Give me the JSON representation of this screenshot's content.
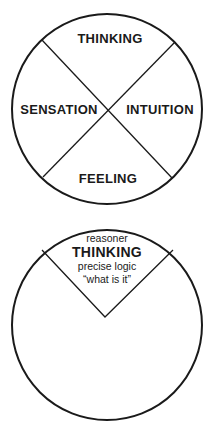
{
  "diagram1": {
    "quadrants": {
      "top": "THINKING",
      "left": "SENSATION",
      "right": "INTUITION",
      "bottom": "FEELING"
    }
  },
  "diagram2": {
    "wedge": {
      "above": "reasoner",
      "title": "THINKING",
      "line1": "precise logic",
      "line2": "“what is it”"
    }
  },
  "colors": {
    "stroke": "#1a1a1a",
    "background": "#ffffff"
  }
}
